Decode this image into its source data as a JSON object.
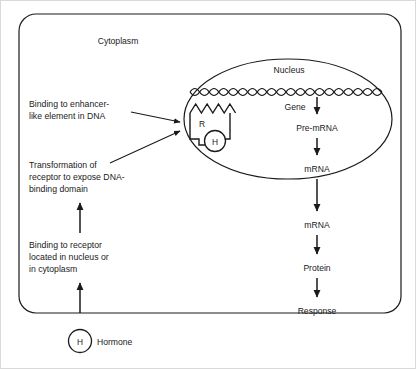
{
  "diagram": {
    "compartments": {
      "cytoplasm_label": "Cytoplasm",
      "nucleus_label": "Nucleus"
    },
    "colors": {
      "background": "#ffffff",
      "stroke": "#1a1a1a",
      "text": "#1a1a1a"
    },
    "annotations": [
      {
        "id": "enhancer-binding",
        "lines": [
          "Binding to enhancer-",
          "like element in DNA"
        ]
      },
      {
        "id": "receptor-transformation",
        "lines": [
          "Transformation of",
          "receptor to expose DNA-",
          "binding domain"
        ]
      },
      {
        "id": "receptor-binding",
        "lines": [
          "Binding to receptor",
          "located in nucleus or",
          "in cytoplasm"
        ]
      }
    ],
    "receptor": {
      "symbol": "R",
      "bound_hormone_symbol": "H"
    },
    "hormone": {
      "symbol": "H",
      "label": "Hormone"
    },
    "pathway": {
      "gene_label": "Gene",
      "steps": [
        "Pre-mRNA",
        "mRNA",
        "mRNA",
        "Protein",
        "Response"
      ]
    },
    "dna": {
      "repeat_count": 20,
      "description": "double-helix strand"
    }
  }
}
